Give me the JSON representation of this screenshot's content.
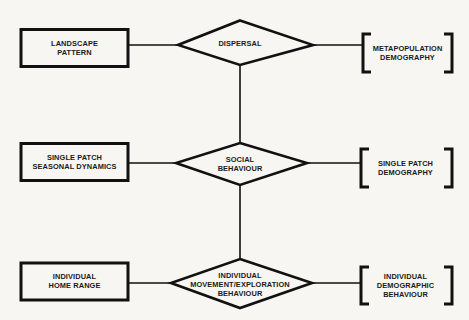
{
  "diagram": {
    "colors": {
      "stroke": "#111111",
      "background": "#f7f6f3",
      "text": "#1a1a1a"
    },
    "rows": [
      {
        "box": {
          "label": "LANDSCAPE\nPATTERN"
        },
        "diamond": {
          "label": "DISPERSAL"
        },
        "bracket": {
          "label": "METAPOPULATION\nDEMOGRAPHY"
        }
      },
      {
        "box": {
          "label": "SINGLE PATCH\nSEASONAL DYNAMICS"
        },
        "diamond": {
          "label": "SOCIAL\nBEHAVIOUR"
        },
        "bracket": {
          "label": "SINGLE PATCH\nDEMOGRAPHY"
        }
      },
      {
        "box": {
          "label": "INDIVIDUAL\nHOME RANGE"
        },
        "diamond": {
          "label": "INDIVIDUAL\nMOVEMENT/EXPLORATION\nBEHAVIOUR"
        },
        "bracket": {
          "label": "INDIVIDUAL\nDEMOGRAPHIC\nBEHAVIOUR"
        }
      }
    ]
  }
}
